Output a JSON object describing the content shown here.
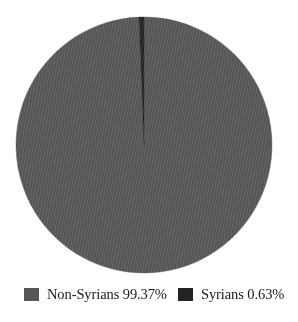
{
  "chart_data": {
    "type": "pie",
    "title": "",
    "subtitle": "",
    "xlabel": "",
    "ylabel": "",
    "grid": false,
    "legend_position": "bottom",
    "start_angle_deg": 0,
    "direction": "clockwise",
    "categories": [
      "Non-Syrians",
      "Syrians"
    ],
    "values": [
      99.37,
      0.63
    ],
    "value_unit": "%",
    "slices": [
      {
        "label": "Non-Syrians",
        "value": 99.37,
        "value_text": "99.37%",
        "legend_text": "Non-Syrians 99.37%",
        "color": "#565656",
        "angle_deg": 357.732
      },
      {
        "label": "Syrians",
        "value": 0.63,
        "value_text": "0.63%",
        "legend_text": "Syrians 0.63%",
        "color": "#232323",
        "angle_deg": 2.268
      }
    ],
    "legend": [
      {
        "text": "Non-Syrians 99.37%",
        "color": "#565656"
      },
      {
        "text": "Syrians 0.63%",
        "color": "#232323"
      }
    ]
  },
  "geometry": {
    "center_x": 144,
    "center_y": 145,
    "radius": 128
  },
  "colors": {
    "background": "#ffffff",
    "slice_major": "#565656",
    "slice_minor": "#232323",
    "text": "#1b1b1b"
  }
}
